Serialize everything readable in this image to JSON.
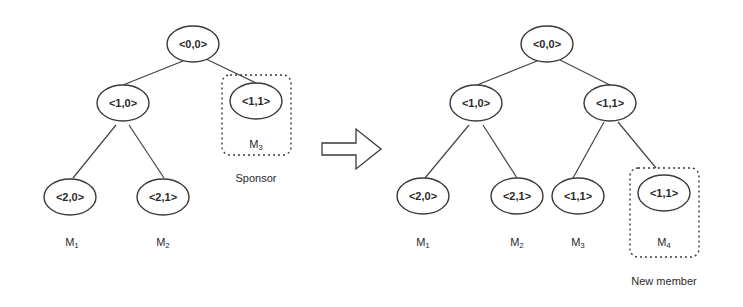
{
  "diagram": {
    "type": "key-tree-join",
    "left_tree": {
      "nodes": [
        {
          "id": "root",
          "label": "<0,0>"
        },
        {
          "id": "n10",
          "label": "<1,0>"
        },
        {
          "id": "n11",
          "label": "<1,1>",
          "member": "M3",
          "highlighted": true,
          "caption": "Sponsor"
        },
        {
          "id": "n20",
          "label": "<2,0>",
          "member": "M1"
        },
        {
          "id": "n21",
          "label": "<2,1>",
          "member": "M2"
        }
      ],
      "edges": [
        [
          "root",
          "n10"
        ],
        [
          "root",
          "n11"
        ],
        [
          "n10",
          "n20"
        ],
        [
          "n10",
          "n21"
        ]
      ],
      "members": {
        "m1": "M1",
        "m2": "M2",
        "m3": "M3"
      },
      "highlight_caption": "Sponsor"
    },
    "arrow": {
      "direction": "right",
      "style": "outlined-block-arrow"
    },
    "right_tree": {
      "nodes": [
        {
          "id": "root",
          "label": "<0,0>"
        },
        {
          "id": "n10",
          "label": "<1,0>"
        },
        {
          "id": "n11",
          "label": "<1,1>"
        },
        {
          "id": "n20",
          "label": "<2,0>",
          "member": "M1"
        },
        {
          "id": "n21",
          "label": "<2,1>",
          "member": "M2"
        },
        {
          "id": "m3node",
          "label": "<1,1>",
          "member": "M3"
        },
        {
          "id": "m4node",
          "label": "<1,1>",
          "member": "M4",
          "highlighted": true,
          "caption": "New member"
        }
      ],
      "edges": [
        [
          "root",
          "n10"
        ],
        [
          "root",
          "n11"
        ],
        [
          "n10",
          "n20"
        ],
        [
          "n10",
          "n21"
        ],
        [
          "n11",
          "m3node"
        ],
        [
          "n11",
          "m4node"
        ]
      ],
      "members": {
        "m1": "M1",
        "m2": "M2",
        "m3": "M3",
        "m4": "M4"
      },
      "highlight_caption": "New member"
    }
  }
}
